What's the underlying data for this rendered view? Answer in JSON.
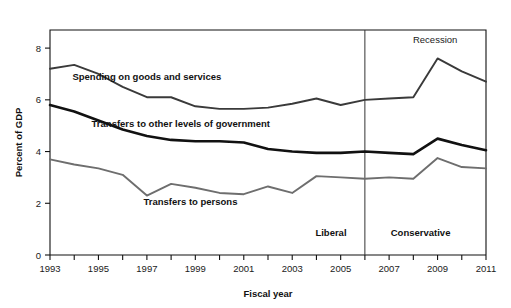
{
  "chart_data": {
    "type": "line",
    "title": "",
    "xlabel": "Fiscal year",
    "ylabel": "Percent of GDP",
    "x": [
      1993,
      1994,
      1995,
      1996,
      1997,
      1998,
      1999,
      2000,
      2001,
      2002,
      2003,
      2004,
      2005,
      2006,
      2007,
      2008,
      2009,
      2010,
      2011
    ],
    "xlim": [
      1993,
      2011
    ],
    "ylim": [
      0,
      8.7
    ],
    "xticks": [
      1993,
      1994,
      1995,
      1996,
      1997,
      1998,
      1999,
      2000,
      2001,
      2002,
      2003,
      2004,
      2005,
      2006,
      2007,
      2008,
      2009,
      2010,
      2011
    ],
    "xticklabels": [
      "1993",
      "",
      "1995",
      "",
      "1997",
      "",
      "1999",
      "",
      "2001",
      "",
      "2003",
      "",
      "2005",
      "",
      "2007",
      "",
      "2009",
      "",
      "2011"
    ],
    "yticks": [
      0,
      2,
      4,
      6,
      8
    ],
    "yticklabels": [
      "0",
      "2",
      "4",
      "6",
      "8"
    ],
    "grid": false,
    "legend_position": "inline-annotations",
    "series": [
      {
        "name": "Spending on goods and services",
        "color": "#3a3a3a",
        "stroke_width": 1.9,
        "label_x": 1997.0,
        "label_y": 6.75,
        "values": [
          7.2,
          7.35,
          7.0,
          6.5,
          6.1,
          6.1,
          5.75,
          5.65,
          5.65,
          5.7,
          5.85,
          6.05,
          5.8,
          6.0,
          6.05,
          6.1,
          7.6,
          7.1,
          6.7
        ]
      },
      {
        "name": "Transfers to other levels of government",
        "color": "#111111",
        "stroke_width": 2.6,
        "label_x": 1998.4,
        "label_y": 4.95,
        "values": [
          5.8,
          5.55,
          5.2,
          4.85,
          4.6,
          4.45,
          4.4,
          4.4,
          4.35,
          4.1,
          4.0,
          3.95,
          3.95,
          4.0,
          3.95,
          3.9,
          4.5,
          4.25,
          4.05
        ]
      },
      {
        "name": "Transfers to persons",
        "color": "#6e6e6e",
        "stroke_width": 1.9,
        "label_x": 1998.8,
        "label_y": 1.95,
        "values": [
          3.7,
          3.5,
          3.35,
          3.1,
          2.3,
          2.75,
          2.6,
          2.4,
          2.35,
          2.65,
          2.4,
          3.05,
          3.0,
          2.95,
          3.0,
          2.95,
          3.75,
          3.4,
          3.35
        ]
      }
    ],
    "annotations": [
      {
        "name": "recession-annotation",
        "text": "Recession",
        "x": 2008.9,
        "y": 8.2,
        "bold": false
      },
      {
        "name": "liberal-era-label",
        "text": "Liberal",
        "x": 2004.6,
        "y": 0.75,
        "bold": true
      },
      {
        "name": "conservative-era-label",
        "text": "Conservative",
        "x": 2008.3,
        "y": 0.75,
        "bold": true
      }
    ],
    "vertical_divider": {
      "name": "era-divider",
      "x": 2006.0
    }
  },
  "colors": {
    "axis": "#111111",
    "background": "#ffffff",
    "spending": "#3a3a3a",
    "gov_transfers": "#111111",
    "person_transfers": "#6e6e6e"
  }
}
